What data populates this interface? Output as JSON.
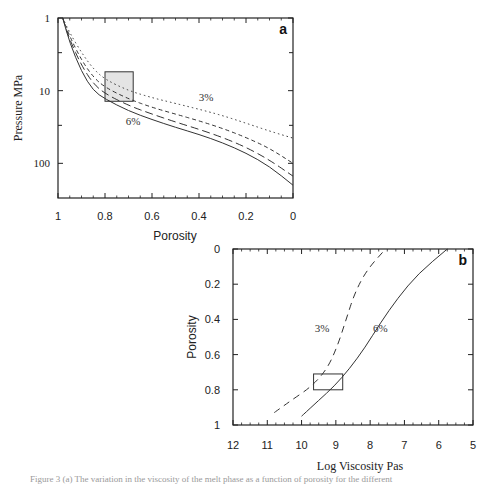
{
  "figure": {
    "caption_fragment": "Figure 3 (a) The variation in the viscosity of the melt phase as a function of porosity for the different"
  },
  "chart_data": [
    {
      "panel": "a",
      "type": "line",
      "title": "",
      "panel_label": "a",
      "xlabel": "Porosity",
      "ylabel": "Pressure  MPa",
      "x_ticks": [
        "1",
        "0.8",
        "0.6",
        "0.4",
        "0.2",
        "0"
      ],
      "y_ticks": [
        "1",
        "10",
        "100"
      ],
      "xlim": [
        1,
        0
      ],
      "ylim": [
        1,
        300
      ],
      "y_scale": "log",
      "y_inverted": true,
      "grid": false,
      "annotations": [
        {
          "text": "3%",
          "x": 0.37,
          "y": 14
        },
        {
          "text": "6%",
          "x": 0.68,
          "y": 30
        },
        {
          "shape": "shaded-rectangle",
          "x_range": [
            0.8,
            0.68
          ],
          "y_range": [
            5.5,
            14
          ]
        }
      ],
      "series": [
        {
          "name": "3%",
          "style": "dotted",
          "x": [
            0.98,
            0.95,
            0.9,
            0.85,
            0.8,
            0.7,
            0.6,
            0.5,
            0.4,
            0.3,
            0.2,
            0.1,
            0.0
          ],
          "y": [
            1,
            1.6,
            3,
            5,
            7,
            10,
            12.5,
            15,
            18,
            22,
            28,
            36,
            45
          ]
        },
        {
          "name": "4%",
          "style": "short-dash",
          "x": [
            0.98,
            0.95,
            0.9,
            0.85,
            0.8,
            0.7,
            0.6,
            0.5,
            0.4,
            0.3,
            0.2,
            0.1,
            0.0
          ],
          "y": [
            1,
            1.8,
            3.8,
            6.5,
            9,
            13,
            17,
            21,
            26,
            33,
            44,
            62,
            100
          ]
        },
        {
          "name": "5%",
          "style": "long-dash",
          "x": [
            0.98,
            0.95,
            0.9,
            0.85,
            0.8,
            0.7,
            0.6,
            0.5,
            0.4,
            0.3,
            0.2,
            0.1,
            0.0
          ],
          "y": [
            1,
            2,
            4.5,
            8,
            11,
            16,
            21,
            27,
            34,
            44,
            60,
            90,
            150
          ]
        },
        {
          "name": "6%",
          "style": "solid",
          "x": [
            0.98,
            0.95,
            0.9,
            0.85,
            0.8,
            0.7,
            0.6,
            0.5,
            0.4,
            0.3,
            0.2,
            0.1,
            0.0
          ],
          "y": [
            1,
            2.2,
            5.5,
            10,
            13,
            19,
            25,
            32,
            40,
            52,
            72,
            110,
            200
          ]
        }
      ]
    },
    {
      "panel": "b",
      "type": "line",
      "title": "",
      "panel_label": "b",
      "xlabel": "Log Viscosity Pas",
      "ylabel": "Porosity",
      "x_ticks": [
        "12",
        "11",
        "10",
        "9",
        "8",
        "7",
        "6",
        "5"
      ],
      "y_ticks": [
        "0",
        "0.2",
        "0.4",
        "0.6",
        "0.8",
        "1"
      ],
      "xlim": [
        12,
        5
      ],
      "ylim": [
        0,
        1
      ],
      "y_inverted": true,
      "grid": false,
      "annotations": [
        {
          "text": "3%",
          "x": 9.4,
          "y": 0.47
        },
        {
          "text": "6%",
          "x": 7.7,
          "y": 0.47
        },
        {
          "shape": "rectangle",
          "x_range": [
            9.65,
            8.8
          ],
          "y_range": [
            0.71,
            0.8
          ]
        }
      ],
      "series": [
        {
          "name": "3%",
          "style": "dashed",
          "x": [
            10.8,
            10.3,
            9.7,
            9.25,
            8.95,
            8.7,
            8.45,
            8.1,
            7.55
          ],
          "y": [
            0.93,
            0.86,
            0.78,
            0.68,
            0.55,
            0.4,
            0.25,
            0.12,
            0.0
          ]
        },
        {
          "name": "6%",
          "style": "solid",
          "x": [
            10.0,
            9.5,
            9.05,
            8.6,
            8.15,
            7.7,
            7.2,
            6.6,
            5.75
          ],
          "y": [
            0.95,
            0.86,
            0.78,
            0.68,
            0.56,
            0.42,
            0.28,
            0.14,
            0.0
          ]
        }
      ]
    }
  ]
}
